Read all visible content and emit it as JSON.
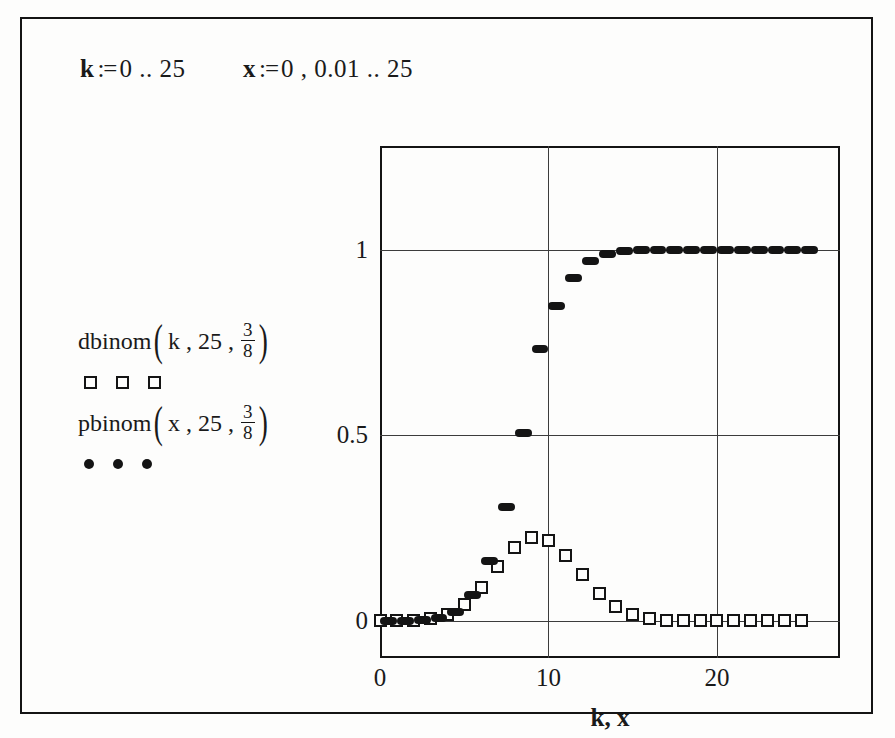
{
  "document": {
    "definitions": [
      {
        "id": "def-k",
        "variable": "k",
        "operator": ":=",
        "expression": "0 .. 25",
        "text": "k := 0 .. 25"
      },
      {
        "id": "def-x",
        "variable": "x",
        "operator": ":=",
        "expression": "0 , 0.01 .. 25",
        "text": "x := 0 , 0.01 .. 25"
      }
    ]
  },
  "legend": {
    "entries": [
      {
        "function": "dbinom",
        "args": "k , 25 ,",
        "frac_num": "3",
        "frac_den": "8",
        "marker": "open-square",
        "marker_count": 3,
        "full_text": "dbinom(k, 25, 3/8)"
      },
      {
        "function": "pbinom",
        "args": "x , 25 ,",
        "frac_num": "3",
        "frac_den": "8",
        "marker": "filled-dot",
        "marker_count": 3,
        "full_text": "pbinom(x, 25, 3/8)"
      }
    ]
  },
  "chart_data": {
    "type": "scatter",
    "title": "",
    "xlabel": "k, x",
    "ylabel": "",
    "xlim": [
      0,
      27.3
    ],
    "ylim": [
      -0.1,
      1.28
    ],
    "grid": true,
    "legend_position": "left-external",
    "xticks": [
      0,
      10,
      20
    ],
    "xticklabels": [
      "0",
      "10",
      "20"
    ],
    "yticks": [
      0,
      0.5,
      1
    ],
    "yticklabels": [
      "0",
      "0.5",
      "1"
    ],
    "parameters": {
      "n": 25,
      "p": 0.375,
      "p_text": "3/8"
    },
    "series": [
      {
        "name": "dbinom(k, 25, 3/8)",
        "marker": "open-square",
        "type": "scatter",
        "x": [
          0,
          1,
          2,
          3,
          4,
          5,
          6,
          7,
          8,
          9,
          10,
          11,
          12,
          13,
          14,
          15,
          16,
          17,
          18,
          19,
          20,
          21,
          22,
          23,
          24,
          25
        ],
        "values": [
          0.0,
          0.0002,
          0.0012,
          0.0054,
          0.0179,
          0.0452,
          0.0904,
          0.1473,
          0.1989,
          0.2252,
          0.2162,
          0.1769,
          0.1238,
          0.0743,
          0.0382,
          0.0168,
          0.0063,
          0.002,
          0.0005,
          0.0001,
          0.0,
          0.0,
          0.0,
          0.0,
          0.0,
          0.0
        ]
      },
      {
        "name": "pbinom(x, 25, 3/8)",
        "marker": "filled-dot",
        "type": "step",
        "x": [
          0,
          1,
          2,
          3,
          4,
          5,
          6,
          7,
          8,
          9,
          10,
          11,
          12,
          13,
          14,
          15,
          16,
          17,
          18,
          19,
          20,
          21,
          22,
          23,
          24,
          25
        ],
        "values": [
          0.0,
          0.0002,
          0.0015,
          0.0069,
          0.0248,
          0.07,
          0.1604,
          0.3077,
          0.5066,
          0.7318,
          0.848,
          0.9249,
          0.9687,
          0.9889,
          0.9971,
          0.9993,
          0.9998,
          1.0,
          1.0,
          1.0,
          1.0,
          1.0,
          1.0,
          1.0,
          1.0,
          1.0
        ]
      }
    ]
  }
}
